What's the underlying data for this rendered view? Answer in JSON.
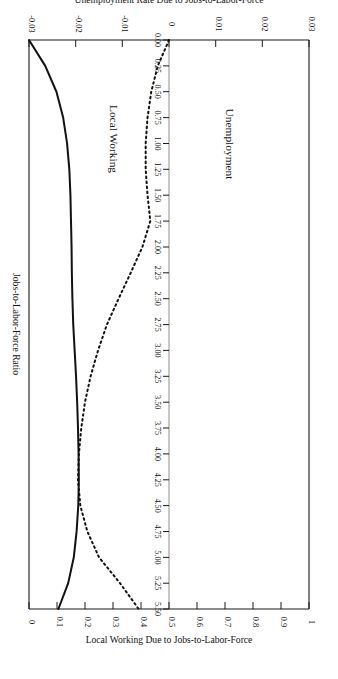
{
  "figure": {
    "rotation_note": "180",
    "background": "#ffffff",
    "ink_color": "#111111"
  },
  "chart_data": {
    "type": "line",
    "title": "",
    "orientation": "horizontal-value-vertical-category",
    "xlabel": "Jobs-to-Labor-Force Ratio",
    "x": "ratio",
    "axis_category": {
      "name": "Jobs-to-Labor-Force Ratio",
      "lim": [
        0,
        5.5
      ],
      "ticks": [
        0.0,
        0.25,
        0.5,
        0.75,
        1.0,
        1.25,
        1.5,
        1.75,
        2.0,
        2.25,
        2.5,
        2.75,
        3.0,
        3.25,
        3.5,
        3.75,
        4.0,
        4.25,
        4.5,
        4.75,
        5.0,
        5.25,
        5.5
      ],
      "ticklabels": [
        "0.00",
        "0.25",
        "0.50",
        "0.75",
        "1.00",
        "1.25",
        "1.50",
        "1.75",
        "2.00",
        "2.25",
        "2.50",
        "2.75",
        "3.00",
        "3.25",
        "3.50",
        "3.75",
        "4.00",
        "4.25",
        "4.50",
        "4.75",
        "5.00",
        "5.25",
        "5.50"
      ]
    },
    "axis_bottom": {
      "name": "Unemployment Rate Due to Jobs-to-Labor-Force",
      "lim": [
        0.03,
        -0.03
      ],
      "ticks": [
        0.03,
        0.02,
        0.01,
        0,
        -0.01,
        -0.02,
        -0.03
      ],
      "ticklabels": [
        "0.03",
        "0.02",
        "0.01",
        "0",
        "-0.01",
        "-0.02",
        "-0.03"
      ]
    },
    "axis_top": {
      "name": "Local Working Due to Jobs-to-Labor-Force",
      "lim": [
        1,
        0
      ],
      "ticks": [
        1,
        0.9,
        0.8,
        0.7,
        0.6,
        0.5,
        0.4,
        0.3,
        0.2,
        0.1,
        0
      ],
      "ticklabels": [
        "1",
        "0.9",
        "0.8",
        "0.7",
        "0.6",
        "0.5",
        "0.4",
        "0.3",
        "0.2",
        "0.1",
        "0"
      ]
    },
    "grid": false,
    "legend": "inline-labels",
    "series": [
      {
        "name": "Unemployment",
        "label": "Unemployment",
        "style": "dotted",
        "axis": "bottom",
        "units": "unemployment rate change",
        "ratio": [
          0.0,
          0.25,
          0.5,
          0.75,
          1.0,
          1.25,
          1.5,
          1.75,
          2.0,
          2.25,
          2.5,
          2.75,
          3.0,
          3.25,
          3.5,
          3.75,
          4.0,
          4.25,
          4.5,
          4.75,
          5.0,
          5.25,
          5.5
        ],
        "values": [
          0.0,
          -0.0024,
          -0.0038,
          -0.0046,
          -0.005,
          -0.005,
          -0.0046,
          -0.004,
          -0.0057,
          -0.0082,
          -0.0108,
          -0.0133,
          -0.0152,
          -0.0168,
          -0.018,
          -0.0188,
          -0.0193,
          -0.0195,
          -0.019,
          -0.0175,
          -0.015,
          -0.0105,
          -0.0065
        ]
      },
      {
        "name": "Local Working",
        "label": "Local Working",
        "style": "solid",
        "axis": "top",
        "units": "local working share",
        "ratio": [
          0.0,
          0.25,
          0.5,
          0.75,
          1.0,
          1.25,
          1.5,
          1.75,
          2.0,
          2.25,
          2.5,
          2.75,
          3.0,
          3.25,
          3.5,
          3.75,
          4.0,
          4.25,
          4.5,
          4.75,
          5.0,
          5.25,
          5.5
        ],
        "values": [
          0.0,
          0.058,
          0.098,
          0.122,
          0.136,
          0.144,
          0.148,
          0.15,
          0.152,
          0.153,
          0.155,
          0.158,
          0.163,
          0.168,
          0.172,
          0.175,
          0.177,
          0.178,
          0.176,
          0.17,
          0.16,
          0.14,
          0.105
        ]
      }
    ],
    "annotations": [
      {
        "text": "Unemployment",
        "at_ratio": 0.9,
        "series": "Unemployment"
      },
      {
        "text": "Local Working",
        "at_ratio": 0.9,
        "series": "Local Working"
      }
    ]
  }
}
